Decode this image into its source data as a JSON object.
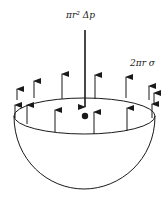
{
  "diagram": {
    "labels": {
      "pressure_force": "πr² Δp",
      "surface_tension_force": "2πr σ"
    },
    "elements": {
      "hemisphere": "bubble-half",
      "central_arrow": "downward-pressure-force",
      "rim_arrows": "upward-surface-tension-forces",
      "center_point": "dot"
    },
    "colors": {
      "stroke": "#1a1a1a",
      "background": "#ffffff"
    }
  }
}
